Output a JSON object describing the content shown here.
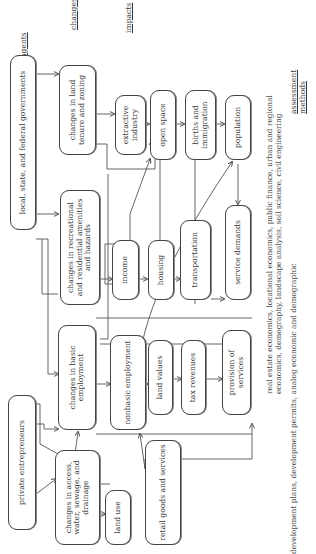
{
  "headers": {
    "agents": "agents",
    "changes": "changes",
    "impacts": "impacts",
    "assessment_methods_1": "assessment",
    "assessment_methods_2": "methods"
  },
  "agents": {
    "governments": "local, state, and federal governments",
    "entrepreneurs": "private entrepreneurs"
  },
  "changes": {
    "land_tenure": "changes in land tenure and zoning",
    "recreational": "changes in recreational and residential amenities and hazards",
    "basic_employment": "changes in basic employment",
    "access": "changes in access, water, sewage, and drainage"
  },
  "impacts": {
    "extractive_industry": "extractive industry",
    "open_space": "open space",
    "births_immigration": "births and immigration",
    "population": "population",
    "income": "income",
    "housing": "housing",
    "transportation": "transportation",
    "service_demands": "service demands",
    "nonbasic_employment": "nonbasic employment",
    "land_values": "land values",
    "tax_revenues": "tax revenues",
    "provision_of_services": "provision of services",
    "land_use": "land use",
    "retail": "retail goods and services"
  },
  "methods": {
    "line1": "real estate economics, locational economics, public finance, urban and regional",
    "line2": "economics, demography, landscape analysis, soil science, civil engineering",
    "line3": "development plans, development permits, analog economic and demographic"
  }
}
